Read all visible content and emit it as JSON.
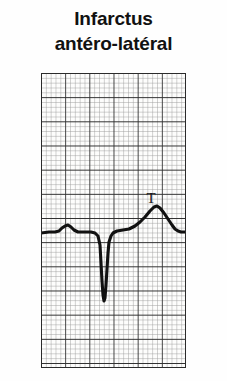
{
  "figure": {
    "kind": "ecg-rhythm-strip",
    "background_color": "#fefefe",
    "caption": {
      "line1": "Infarctus",
      "line2": "antéro-latéral",
      "color": "#111111"
    }
  },
  "ecg": {
    "paper": {
      "color": "#fdfdfc",
      "minor_color": "#9a9a9a",
      "major_color": "#2b2b2b",
      "minor_cell_px": 4.83,
      "major_every": 5,
      "x": 41,
      "y": 73,
      "width": 145,
      "height": 295,
      "minor_cols": 30,
      "minor_rows": 61
    },
    "trace": {
      "color": "#111111",
      "stroke_width": 3.1,
      "baseline_y": 159,
      "label": "QS complex with ST elevation and tall T wave"
    },
    "annotations": [
      {
        "name": "t-wave-marker",
        "text": "T",
        "x": 110,
        "y": 123
      }
    ]
  },
  "chart_data": {
    "type": "line",
    "title": "Infarctus antéro-latéral",
    "xlabel": "",
    "ylabel": "",
    "grid": true,
    "legend": false,
    "x_range": [
      0,
      145
    ],
    "y_range": [
      0,
      295
    ],
    "series": [
      {
        "name": "ecg-lead-trace",
        "description": "Baseline, small P wave, deep QS complex, elevated ST segment, peaked T wave, return to baseline",
        "points": [
          [
            0,
            160
          ],
          [
            8,
            159
          ],
          [
            14,
            159
          ],
          [
            18,
            158
          ],
          [
            21,
            155
          ],
          [
            24,
            153
          ],
          [
            27,
            152
          ],
          [
            30,
            154
          ],
          [
            33,
            157
          ],
          [
            37,
            159
          ],
          [
            44,
            159
          ],
          [
            50,
            159
          ],
          [
            54,
            160
          ],
          [
            57,
            163
          ],
          [
            59,
            172
          ],
          [
            60,
            190
          ],
          [
            61,
            208
          ],
          [
            62,
            222
          ],
          [
            63,
            228
          ],
          [
            64,
            225
          ],
          [
            65,
            212
          ],
          [
            66,
            196
          ],
          [
            67,
            180
          ],
          [
            68,
            169
          ],
          [
            70,
            163
          ],
          [
            72,
            160
          ],
          [
            76,
            158
          ],
          [
            82,
            157
          ],
          [
            88,
            156
          ],
          [
            94,
            153
          ],
          [
            99,
            149
          ],
          [
            104,
            144
          ],
          [
            109,
            138
          ],
          [
            113,
            134
          ],
          [
            116,
            133
          ],
          [
            119,
            135
          ],
          [
            123,
            140
          ],
          [
            127,
            146
          ],
          [
            131,
            152
          ],
          [
            134,
            156
          ],
          [
            137,
            158
          ],
          [
            140,
            159
          ],
          [
            145,
            159
          ]
        ]
      }
    ]
  }
}
